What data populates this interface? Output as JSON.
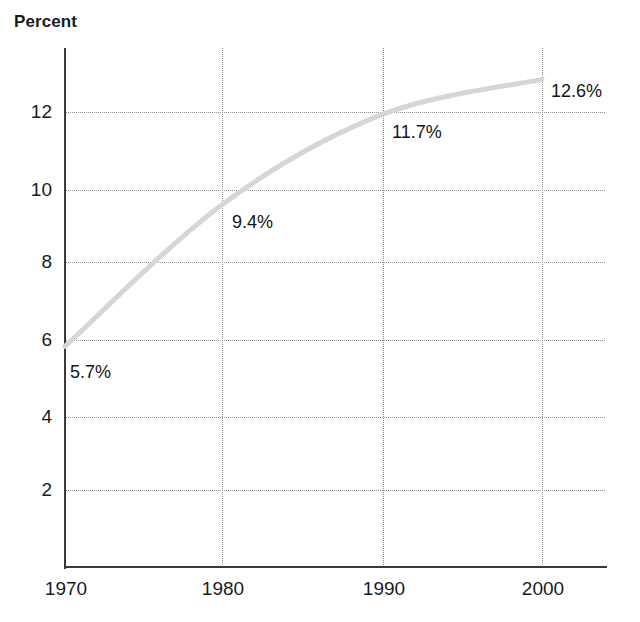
{
  "chart_data": {
    "type": "line",
    "title": "",
    "ylabel": "Percent",
    "xlabel": "",
    "x": [
      1970,
      1980,
      1990,
      2000
    ],
    "categories": [
      "1970",
      "1980",
      "1990",
      "2000"
    ],
    "values": [
      5.7,
      9.4,
      11.7,
      12.6
    ],
    "point_labels": [
      "5.7%",
      "9.4%",
      "11.7%",
      "12.6%"
    ],
    "xlim": [
      1970,
      2000
    ],
    "ylim": [
      0,
      13.5
    ],
    "yticks": [
      2,
      4,
      6,
      8,
      10,
      12
    ],
    "ytick_labels": [
      "2",
      "4",
      "6",
      "8",
      "10",
      "12"
    ],
    "xticks": [
      1970,
      1980,
      1990,
      2000
    ],
    "xtick_labels": [
      "1970",
      "1980",
      "1990",
      "2000"
    ],
    "grid": true,
    "grid_style": "dotted",
    "legend": "none",
    "series": [
      {
        "name": "Percent",
        "values": [
          5.7,
          9.4,
          11.7,
          12.6
        ],
        "color": "#d6d6d6"
      }
    ],
    "colors": {
      "line": "#d6d6d6",
      "axis": "#3a3a3a",
      "grid": "#8d8d8d",
      "text": "#1b1b1b",
      "background": "#ffffff"
    }
  },
  "axis_title": "Percent",
  "y_ticks": [
    {
      "label": "12",
      "value": 12
    },
    {
      "label": "10",
      "value": 10
    },
    {
      "label": "8",
      "value": 8
    },
    {
      "label": "6",
      "value": 6
    },
    {
      "label": "4",
      "value": 4
    },
    {
      "label": "2",
      "value": 2
    }
  ],
  "x_ticks": [
    {
      "label": "1970",
      "value": 1970
    },
    {
      "label": "1980",
      "value": 1980
    },
    {
      "label": "1990",
      "value": 1990
    },
    {
      "label": "2000",
      "value": 2000
    }
  ],
  "point_labels": [
    {
      "text": "5.7%",
      "year": "1970"
    },
    {
      "text": "9.4%",
      "year": "1980"
    },
    {
      "text": "11.7%",
      "year": "1990"
    },
    {
      "text": "12.6%",
      "year": "2000"
    }
  ]
}
